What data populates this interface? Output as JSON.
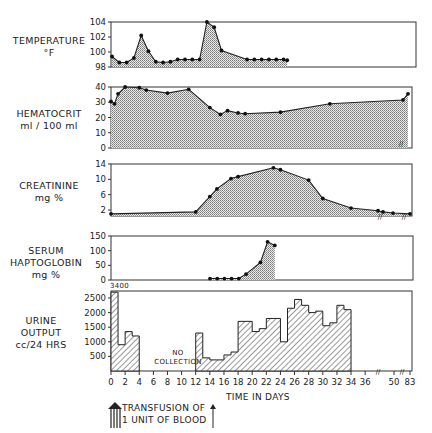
{
  "labels": {
    "temperature": [
      "TEMPERATURE",
      "°F"
    ],
    "hematocrit": [
      "HEMATOCRIT",
      "ml / 100 ml"
    ],
    "creatinine": [
      "CREATININE",
      "mg %"
    ],
    "haptoglobin": [
      "SERUM",
      "HAPTOGLOBIN",
      "mg %"
    ],
    "urine": [
      "URINE",
      "OUTPUT",
      "cc/24 HRS"
    ],
    "xaxis_title": "TIME IN DAYS",
    "no_collection": [
      "NO",
      "COLLECTION"
    ],
    "urine_overflow": "3400",
    "legend_transfusion": [
      "TRANSFUSION OF",
      "1 UNIT OF BLOOD"
    ]
  },
  "chart_data": [
    {
      "type": "area",
      "title": "Temperature °F",
      "ylabel": "TEMPERATURE °F",
      "yticks": [
        98,
        100,
        102,
        104
      ],
      "ylim": [
        98,
        104
      ],
      "x": [
        0,
        1,
        2,
        3,
        4,
        5,
        6,
        7,
        8,
        9,
        10,
        11,
        12,
        13,
        14,
        15,
        16,
        17,
        18,
        19,
        20,
        21,
        22
      ],
      "values": [
        99.4,
        98.6,
        98.6,
        99.2,
        102.2,
        100.1,
        98.7,
        98.6,
        98.7,
        99.0,
        99.0,
        99.0,
        99.0,
        104.0,
        103.3,
        100.2,
        99.0,
        99.0,
        99.0,
        99.0,
        99.0,
        99.0,
        98.9
      ],
      "xpoints_px": [
        0,
        1,
        2,
        3,
        4,
        5,
        6,
        7,
        8,
        9,
        10,
        11,
        12,
        13,
        14,
        15,
        18.5,
        19.5,
        20.5,
        21.5,
        22.5,
        23.5,
        24
      ]
    },
    {
      "type": "area",
      "title": "Hematocrit ml/100 ml",
      "ylabel": "HEMATOCRIT ml / 100 ml",
      "yticks": [
        0,
        10,
        20,
        30,
        40
      ],
      "ylim": [
        0,
        40
      ],
      "x": [
        0,
        0.5,
        1,
        2,
        4,
        5,
        8,
        11,
        14,
        15.5,
        16.5,
        18,
        19,
        24,
        31,
        37,
        83
      ],
      "values": [
        30.5,
        29,
        35.5,
        40,
        39.5,
        38,
        36,
        38.5,
        26.5,
        22,
        24.5,
        23,
        22.5,
        23.5,
        29,
        31.5,
        35.5
      ]
    },
    {
      "type": "area",
      "title": "Creatinine mg %",
      "ylabel": "CREATININE mg %",
      "yticks": [
        2,
        6,
        10,
        14
      ],
      "ylim": [
        0,
        14
      ],
      "x": [
        0,
        12,
        14,
        15,
        17,
        18,
        23,
        24,
        28,
        30,
        34,
        37,
        40,
        50,
        83
      ],
      "values": [
        1.0,
        1.5,
        5.5,
        7.5,
        10.2,
        10.7,
        13.0,
        12.5,
        9.8,
        5.0,
        2.5,
        1.8,
        1.5,
        1.2,
        1.0
      ]
    },
    {
      "type": "area",
      "title": "Serum Haptoglobin mg %",
      "ylabel": "SERUM HAPTOGLOBIN mg %",
      "yticks": [
        0,
        50,
        100,
        150
      ],
      "ylim": [
        0,
        150
      ],
      "x": [
        14,
        15,
        16,
        17,
        18,
        19,
        21,
        22,
        23
      ],
      "values": [
        5,
        5,
        5,
        5,
        5,
        20,
        60,
        130,
        118
      ]
    },
    {
      "type": "bar",
      "title": "Urine Output cc/24 HRS",
      "ylabel": "URINE OUTPUT cc/24 HRS",
      "yticks": [
        500,
        1000,
        1500,
        2000,
        2500
      ],
      "ylim": [
        0,
        2700
      ],
      "xlabel": "TIME IN DAYS",
      "xticks": [
        0,
        2,
        4,
        6,
        8,
        10,
        12,
        14,
        16,
        18,
        20,
        22,
        24,
        26,
        28,
        30,
        32,
        34,
        36,
        50,
        83
      ],
      "annotations": [
        "3400 (day 0-1, off scale)",
        "NO COLLECTION (days 4-12)"
      ],
      "bars": [
        {
          "start": 0,
          "end": 1,
          "value": 3400
        },
        {
          "start": 1,
          "end": 2,
          "value": 900
        },
        {
          "start": 2,
          "end": 3,
          "value": 1350
        },
        {
          "start": 3,
          "end": 4,
          "value": 1200
        },
        {
          "start": 12,
          "end": 13,
          "value": 1300
        },
        {
          "start": 13,
          "end": 14,
          "value": 450
        },
        {
          "start": 14,
          "end": 15,
          "value": 380
        },
        {
          "start": 15,
          "end": 16,
          "value": 380
        },
        {
          "start": 16,
          "end": 17,
          "value": 550
        },
        {
          "start": 17,
          "end": 18,
          "value": 650
        },
        {
          "start": 18,
          "end": 20,
          "value": 1700
        },
        {
          "start": 20,
          "end": 21,
          "value": 1350
        },
        {
          "start": 21,
          "end": 22,
          "value": 1450
        },
        {
          "start": 22,
          "end": 24,
          "value": 1800
        },
        {
          "start": 24,
          "end": 25,
          "value": 1000
        },
        {
          "start": 25,
          "end": 26,
          "value": 2150
        },
        {
          "start": 26,
          "end": 27,
          "value": 2450
        },
        {
          "start": 27,
          "end": 28,
          "value": 2250
        },
        {
          "start": 28,
          "end": 29,
          "value": 2000
        },
        {
          "start": 29,
          "end": 30,
          "value": 2050
        },
        {
          "start": 30,
          "end": 31,
          "value": 1550
        },
        {
          "start": 31,
          "end": 32,
          "value": 1650
        },
        {
          "start": 32,
          "end": 33,
          "value": 2250
        },
        {
          "start": 33,
          "end": 34,
          "value": 2100
        }
      ]
    }
  ]
}
